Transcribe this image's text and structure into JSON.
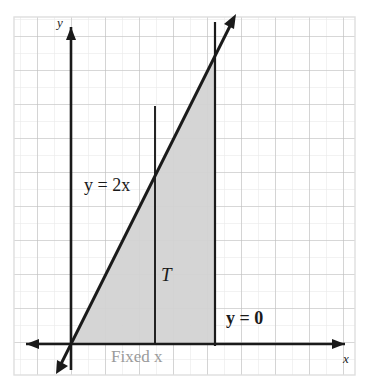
{
  "figure": {
    "kind": "cartesian-graph",
    "background_color": "#ffffff",
    "frame": {
      "x": 14,
      "y": 17,
      "width": 341,
      "height": 358,
      "border_color": "#dcdcdc"
    },
    "grid": {
      "major_color": "#b5b5b5",
      "minor_color": "#e2e2e2",
      "major_spacing": 34,
      "minor_spacing": 17,
      "show_minor": true,
      "show_major": true
    },
    "axes": {
      "color": "#1a1a1a",
      "origin": {
        "x": 71,
        "y": 344
      },
      "x_axis": {
        "label": "x",
        "y": 344,
        "from_x": 22,
        "to_x": 349,
        "arrow_left": true,
        "arrow_right": true
      },
      "y_axis": {
        "label": "y",
        "x": 71,
        "from_y": 375,
        "to_y": 22,
        "arrow_up": true,
        "arrow_down": true
      }
    },
    "line": {
      "name": "y = 2x",
      "label": "y = 2x",
      "equation": "y = 2x",
      "slope": 2,
      "intercept": 0,
      "color": "#1a1a1a",
      "arrow_up": true,
      "arrow_down": true
    },
    "region": {
      "name": "T",
      "label": "T",
      "fill_color": "#d2d2d2",
      "description": "triangle bounded by y = 2x, y = 0 and the vertical line at Fixed x"
    },
    "vertical_line_fixed_x": {
      "label": "Fixed x",
      "label_color": "#9a9a9a",
      "x": 155,
      "color": "#1a1a1a"
    },
    "vertical_line_right": {
      "x": 215,
      "color": "#1a1a1a"
    },
    "baseline": {
      "label": "y = 0"
    }
  },
  "labels": {
    "line_equation": "y = 2x",
    "baseline_equation": "y = 0",
    "region": "T",
    "fixed_x": "Fixed x",
    "axis_y": "y",
    "axis_x": "x"
  }
}
